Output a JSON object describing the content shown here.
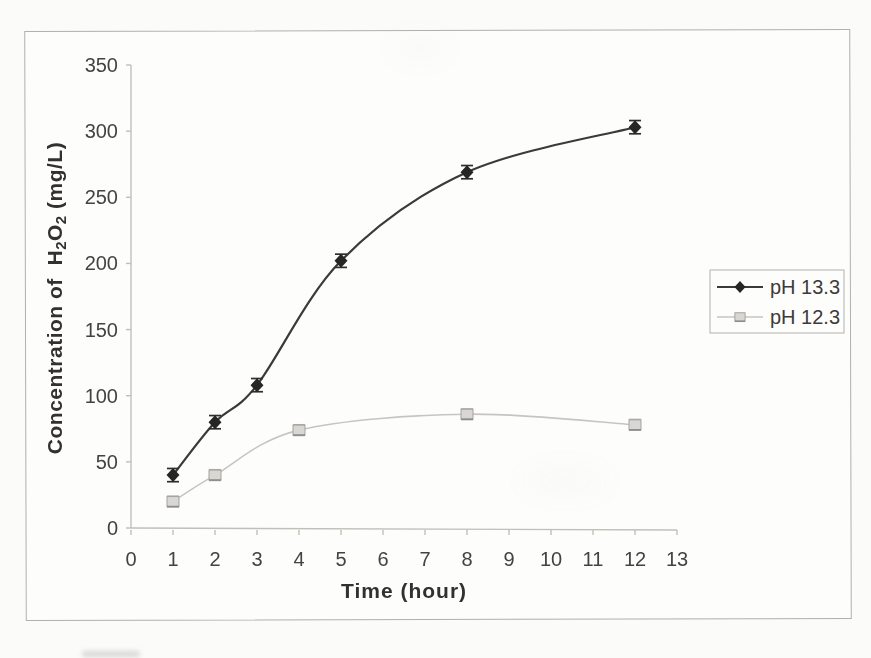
{
  "page": {
    "background": "#fbfbfa"
  },
  "figure": {
    "background": "#fdfdfc",
    "border_color": "#b3afa9"
  },
  "chart_data": {
    "type": "line",
    "title": "",
    "xlabel": "Time (hour)",
    "ylabel": "Concentration of  H₂O₂ (mg/L)",
    "ylabel_parts": [
      {
        "text": "Concentration of  H"
      },
      {
        "text": "2",
        "sub": true
      },
      {
        "text": "O"
      },
      {
        "text": "2",
        "sub": true
      },
      {
        "text": " (mg/L)"
      }
    ],
    "xlim": [
      0,
      13
    ],
    "ylim": [
      0,
      350
    ],
    "x_ticks": [
      0,
      1,
      2,
      3,
      4,
      5,
      6,
      7,
      8,
      9,
      10,
      11,
      12,
      13
    ],
    "y_ticks": [
      0,
      50,
      100,
      150,
      200,
      250,
      300,
      350
    ],
    "grid": false,
    "legend": {
      "position": "outside-right",
      "bordered": true,
      "entries": [
        "pH 13.3",
        "pH 12.3"
      ]
    },
    "series": [
      {
        "name": "pH 13.3",
        "marker": "diamond",
        "line_color": "#3a3a38",
        "marker_fill": "#262624",
        "err_color": "#2e2e2c",
        "x": [
          1,
          2,
          3,
          5,
          8,
          12
        ],
        "y": [
          40,
          80,
          108,
          202,
          269,
          303
        ],
        "y_err": 5
      },
      {
        "name": "pH 12.3",
        "marker": "square",
        "line_color": "#c7c5c1",
        "marker_fill": "#d9d7d3",
        "marker_stroke": "#a6a39e",
        "marker_shade": "#8f8d89",
        "err_color": "#b0aeaa",
        "x": [
          1,
          2,
          4,
          8,
          12
        ],
        "y": [
          20,
          40,
          74,
          86,
          78
        ],
        "y_err": 4
      }
    ],
    "colors": {
      "axis": "#c2bfb9",
      "tick_label": "#45433f",
      "axis_title": "#33312e",
      "legend_text": "#3d3b38"
    }
  }
}
